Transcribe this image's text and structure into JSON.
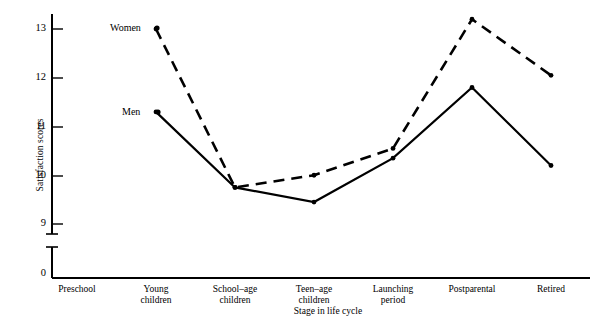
{
  "chart_data": {
    "type": "line",
    "title": "",
    "xlabel": "Stage in life cycle",
    "ylabel": "Satisfaction scores",
    "categories": [
      "Preschool",
      "Young\nchildren",
      "School–age\nchildren",
      "Teen–age\nchildren",
      "Launching\nperiod",
      "Postparental",
      "Retired"
    ],
    "ytick_labels": [
      "0",
      "9",
      "10",
      "11",
      "12",
      "13"
    ],
    "ytick_values": [
      0,
      9,
      10,
      11,
      12,
      13
    ],
    "ylim": [
      9,
      13.5
    ],
    "axis_break": true,
    "grid": false,
    "legend": "inline-labels",
    "series": [
      {
        "name": "Women",
        "style": "dashed",
        "color": "#000000",
        "x": [
          "Young children",
          "School–age children",
          "Teen–age children",
          "Launching period",
          "Postparental",
          "Retired"
        ],
        "values": [
          13.0,
          9.75,
          10.0,
          10.55,
          13.2,
          12.05
        ]
      },
      {
        "name": "Men",
        "style": "solid",
        "color": "#000000",
        "x": [
          "Young children",
          "School–age children",
          "Teen–age children",
          "Launching period",
          "Postparental",
          "Retired"
        ],
        "values": [
          11.3,
          9.75,
          9.45,
          10.35,
          11.8,
          10.2
        ]
      }
    ]
  },
  "axis": {
    "ylabel": "Satisfaction scores",
    "xlabel": "Stage in life cycle",
    "ticks": {
      "t13": "13",
      "t12": "12",
      "t11": "11",
      "t10": "10",
      "t9": "9",
      "t0": "0"
    }
  },
  "categories": {
    "c0": "Preschool",
    "c1": "Young\nchildren",
    "c2": "School–age\nchildren",
    "c3": "Teen–age\nchildren",
    "c4": "Launching\nperiod",
    "c5": "Postparental",
    "c6": "Retired"
  },
  "series_labels": {
    "women": "Women",
    "men": "Men"
  },
  "top_fragment": ""
}
